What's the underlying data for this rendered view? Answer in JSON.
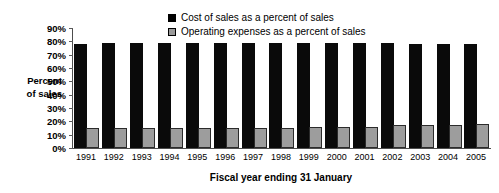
{
  "chart_data": {
    "type": "bar",
    "title": "",
    "xlabel": "Fiscal year ending 31 January",
    "ylabel": "Percent of sales",
    "ylabel_lines": [
      "Percent",
      "of sales"
    ],
    "categories": [
      "1991",
      "1992",
      "1993",
      "1994",
      "1995",
      "1996",
      "1997",
      "1998",
      "1999",
      "2000",
      "2001",
      "2002",
      "2003",
      "2004",
      "2005"
    ],
    "series": [
      {
        "name": "Cost of sales as a percent of sales",
        "color": "#000000",
        "values": [
          78,
          79,
          79,
          79,
          79,
          79,
          79,
          79,
          79,
          79,
          79,
          79,
          78,
          78,
          78
        ]
      },
      {
        "name": "Operating expenses as a percent of sales",
        "color": "#9d9d9d",
        "values": [
          15,
          15,
          15,
          15,
          15,
          15,
          15,
          15,
          16,
          16,
          16,
          17,
          17,
          17,
          18
        ]
      }
    ],
    "ylim": [
      0,
      90
    ],
    "ytick_step": 10,
    "ytick_labels": [
      "90%",
      "80%",
      "70%",
      "60%",
      "50%",
      "40%",
      "30%",
      "20%",
      "10%",
      "0%"
    ],
    "grid": false,
    "legend_position": "top-center"
  }
}
